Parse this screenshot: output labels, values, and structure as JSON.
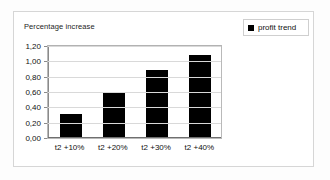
{
  "chart_data": {
    "type": "bar",
    "title": "Percentage increase",
    "xlabel": "",
    "ylabel": "",
    "categories": [
      "t2 +10%",
      "t2 +20%",
      "t2 +30%",
      "t2 +40%"
    ],
    "series": [
      {
        "name": "profit trend",
        "color": "#000000",
        "values": [
          0.3,
          0.58,
          0.88,
          1.07
        ]
      }
    ],
    "ylim": [
      0.0,
      1.2
    ],
    "ytick_values": [
      0.0,
      0.2,
      0.4,
      0.6,
      0.8,
      1.0,
      1.2
    ],
    "ytick_labels": [
      "0,00",
      "0,20",
      "0,40",
      "0,60",
      "0,80",
      "1,00",
      "1,20"
    ],
    "grid": "horizontal",
    "legend_position": "top-right",
    "legend_entries": [
      {
        "label": "profit trend",
        "marker": "filled-square",
        "color": "#000000"
      }
    ]
  },
  "legend": {
    "label": "profit trend"
  },
  "colors": {
    "bar": "#000000",
    "grid": "#d9d9d9",
    "axis": "#8a8a8a",
    "frame": "#d6d6d6",
    "text": "#111111",
    "background": "#ffffff"
  }
}
